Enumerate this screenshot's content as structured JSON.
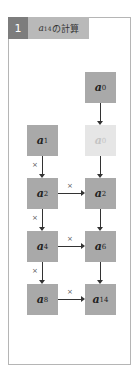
{
  "header": {
    "number": "1",
    "title_base": "a",
    "title_exp": "14",
    "title_suffix": "の計算"
  },
  "boxes": {
    "top_right": {
      "base": "a",
      "exp": "0"
    },
    "left": [
      {
        "base": "a",
        "exp": "1"
      },
      {
        "base": "a",
        "exp": "2"
      },
      {
        "base": "a",
        "exp": "4"
      },
      {
        "base": "a",
        "exp": "8"
      }
    ],
    "right": [
      {
        "base": "a",
        "exp": "0",
        "faded": true
      },
      {
        "base": "a",
        "exp": "2"
      },
      {
        "base": "a",
        "exp": "6"
      },
      {
        "base": "a",
        "exp": "14"
      }
    ]
  },
  "operator_symbol": "×",
  "colors": {
    "box": "#a9a9a9",
    "box_faded": "#e6e6e6",
    "header_num_bg": "#7d7d7d",
    "header_title_bg": "#b9b9b9",
    "frame_border": "#b5b5b5"
  }
}
